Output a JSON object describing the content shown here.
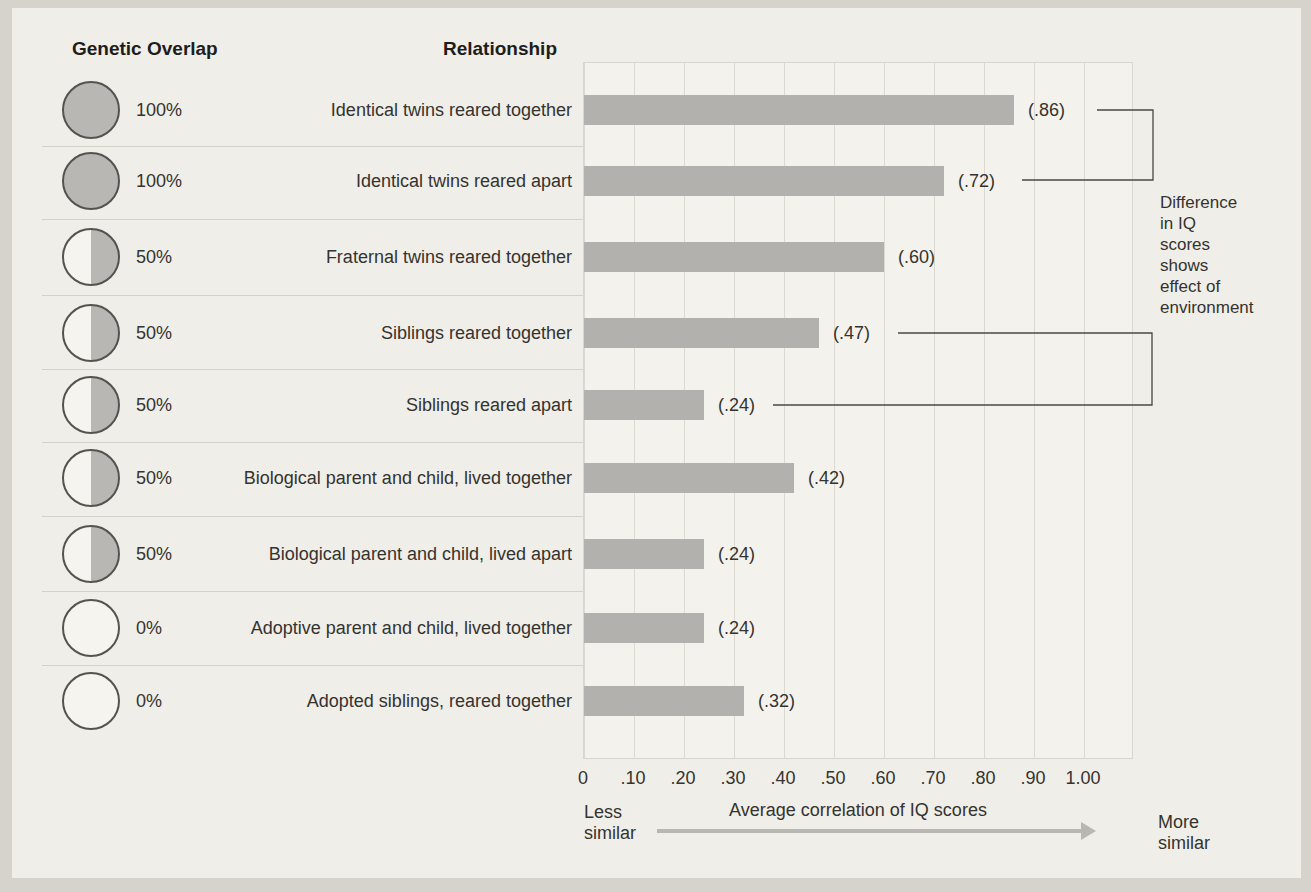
{
  "figure": {
    "column_headers": {
      "genetic_overlap": "Genetic Overlap",
      "relationship": "Relationship"
    },
    "rows": [
      {
        "overlap_pct": "100%",
        "overlap_type": "full",
        "relationship": "Identical twins reared together",
        "value": 0.86,
        "value_label": "(.86)"
      },
      {
        "overlap_pct": "100%",
        "overlap_type": "full",
        "relationship": "Identical twins reared apart",
        "value": 0.72,
        "value_label": "(.72)"
      },
      {
        "overlap_pct": "50%",
        "overlap_type": "half",
        "relationship": "Fraternal twins reared together",
        "value": 0.6,
        "value_label": "(.60)"
      },
      {
        "overlap_pct": "50%",
        "overlap_type": "half",
        "relationship": "Siblings reared together",
        "value": 0.47,
        "value_label": "(.47)"
      },
      {
        "overlap_pct": "50%",
        "overlap_type": "half",
        "relationship": "Siblings reared apart",
        "value": 0.24,
        "value_label": "(.24)"
      },
      {
        "overlap_pct": "50%",
        "overlap_type": "half",
        "relationship": "Biological parent and child, lived together",
        "value": 0.42,
        "value_label": "(.42)"
      },
      {
        "overlap_pct": "50%",
        "overlap_type": "half",
        "relationship": "Biological parent and child, lived apart",
        "value": 0.24,
        "value_label": "(.24)"
      },
      {
        "overlap_pct": "0%",
        "overlap_type": "none",
        "relationship": "Adoptive parent and child, lived together",
        "value": 0.24,
        "value_label": "(.24)"
      },
      {
        "overlap_pct": "0%",
        "overlap_type": "none",
        "relationship": "Adopted siblings, reared together",
        "value": 0.32,
        "value_label": "(.32)"
      }
    ],
    "axis": {
      "ticks": [
        "0",
        ".10",
        ".20",
        ".30",
        ".40",
        ".50",
        ".60",
        ".70",
        ".80",
        ".90",
        "1.00"
      ],
      "title": "Average correlation of IQ scores",
      "left_label": "Less similar",
      "right_label": "More similar"
    },
    "annotation": {
      "text": "Difference in IQ scores shows effect of environment",
      "lines": [
        "Difference",
        "in IQ",
        "scores",
        "shows",
        "effect of",
        "environment"
      ]
    },
    "colors": {
      "bar": "#b3b1ae",
      "circle_fill": "#b9b7b3",
      "plot_background": "#f4f2ec",
      "page_background": "#f0eee8",
      "gridline": "#dcd9d0",
      "text": "#35332f"
    }
  },
  "chart_data": {
    "type": "bar",
    "orientation": "horizontal",
    "title": "",
    "categories": [
      "Identical twins reared together",
      "Identical twins reared apart",
      "Fraternal twins reared together",
      "Siblings reared together",
      "Siblings reared apart",
      "Biological parent and child, lived together",
      "Biological parent and child, lived apart",
      "Adoptive parent and child, lived together",
      "Adopted siblings, reared together"
    ],
    "values": [
      0.86,
      0.72,
      0.6,
      0.47,
      0.24,
      0.42,
      0.24,
      0.24,
      0.32
    ],
    "value_labels": [
      "(.86)",
      "(.72)",
      "(.60)",
      "(.47)",
      "(.24)",
      "(.42)",
      "(.24)",
      "(.24)",
      "(.32)"
    ],
    "genetic_overlap": [
      "100%",
      "100%",
      "50%",
      "50%",
      "50%",
      "50%",
      "50%",
      "0%",
      "0%"
    ],
    "xlabel": "Average correlation of IQ scores",
    "ylabel": "Relationship",
    "xlim": [
      0,
      1.1
    ],
    "xticks": [
      0,
      0.1,
      0.2,
      0.3,
      0.4,
      0.5,
      0.6,
      0.7,
      0.8,
      0.9,
      1.0
    ],
    "grid": "vertical",
    "annotations": [
      "Difference in IQ scores shows effect of environment",
      "Less similar",
      "More similar"
    ],
    "bracket_pairs": [
      {
        "between": [
          "(.86)",
          "(.72)"
        ]
      },
      {
        "between": [
          "(.47)",
          "(.24)"
        ]
      }
    ]
  }
}
